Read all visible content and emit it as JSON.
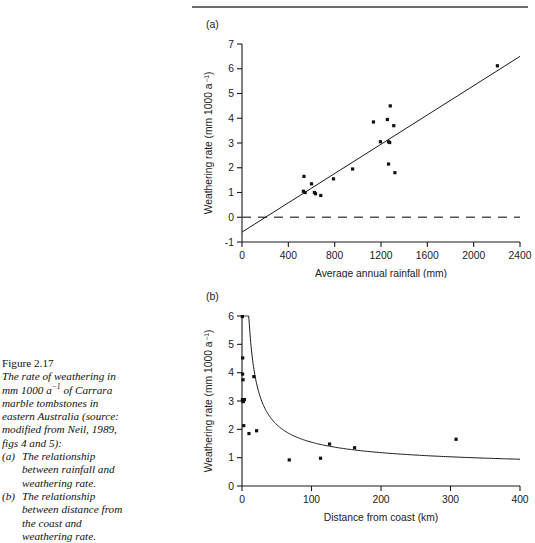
{
  "figure": {
    "number": "Figure 2.17",
    "caption_lines": [
      "The rate of weathering in",
      "mm 1000 a⁻¹ of Carrara",
      "marble tombstones in",
      "eastern Australia (source:",
      "modified from Neil, 1989,",
      "figs 4 and 5):"
    ],
    "subcaptions": [
      {
        "marker": "(a)",
        "lines": [
          "The relationship",
          "between rainfall and",
          "weathering rate."
        ]
      },
      {
        "marker": "(b)",
        "lines": [
          "The relationship",
          "between distance from",
          "the coast and",
          "weathering rate."
        ]
      }
    ]
  },
  "chart_data": [
    {
      "type": "scatter",
      "panel_label": "(a)",
      "title": "",
      "xlabel": "Average annual rainfall (mm)",
      "ylabel": "Weathering rate (mm 1000 a⁻¹)",
      "xlim": [
        0,
        2400
      ],
      "ylim": [
        -1,
        7
      ],
      "xticks": [
        0,
        400,
        800,
        1200,
        1600,
        2000,
        2400
      ],
      "xtick_labels": [
        "0",
        "400",
        "800",
        "1200",
        "1600",
        "2000",
        "2400"
      ],
      "yticks": [
        -1,
        0,
        1,
        2,
        3,
        4,
        5,
        6,
        7
      ],
      "ytick_labels": [
        "-1",
        "0",
        "1",
        "2",
        "3",
        "4",
        "5",
        "6",
        "7"
      ],
      "grid": false,
      "legend": null,
      "points": [
        {
          "x": 535,
          "y": 1.65
        },
        {
          "x": 530,
          "y": 1.05
        },
        {
          "x": 545,
          "y": 1.0
        },
        {
          "x": 600,
          "y": 1.35
        },
        {
          "x": 625,
          "y": 1.0
        },
        {
          "x": 635,
          "y": 0.95
        },
        {
          "x": 680,
          "y": 0.88
        },
        {
          "x": 790,
          "y": 1.55
        },
        {
          "x": 955,
          "y": 1.95
        },
        {
          "x": 1135,
          "y": 3.85
        },
        {
          "x": 1195,
          "y": 3.05
        },
        {
          "x": 1255,
          "y": 3.95
        },
        {
          "x": 1265,
          "y": 3.05
        },
        {
          "x": 1275,
          "y": 3.02
        },
        {
          "x": 1280,
          "y": 4.5
        },
        {
          "x": 1265,
          "y": 2.15
        },
        {
          "x": 1310,
          "y": 3.7
        },
        {
          "x": 1320,
          "y": 1.8
        },
        {
          "x": 2205,
          "y": 6.12
        }
      ],
      "fit_line": {
        "x0": 0,
        "y0": -0.6,
        "x1": 2400,
        "y1": 6.5
      },
      "reference_line": {
        "y": 0,
        "style": "dashed"
      }
    },
    {
      "type": "scatter",
      "panel_label": "(b)",
      "title": "",
      "xlabel": "Distance from coast (km)",
      "ylabel": "Weathering rate (mm 1000 a⁻¹)",
      "xlim": [
        0,
        400
      ],
      "ylim": [
        0,
        6
      ],
      "xticks": [
        0,
        100,
        200,
        300,
        400
      ],
      "xtick_labels": [
        "0",
        "100",
        "200",
        "300",
        "400"
      ],
      "yticks": [
        0,
        1,
        2,
        3,
        4,
        5,
        6
      ],
      "ytick_labels": [
        "0",
        "1",
        "2",
        "3",
        "4",
        "5",
        "6"
      ],
      "grid": false,
      "legend": null,
      "points": [
        {
          "x": 0.5,
          "y": 5.98
        },
        {
          "x": 1.0,
          "y": 4.52
        },
        {
          "x": 0.8,
          "y": 3.95
        },
        {
          "x": 1.5,
          "y": 3.75
        },
        {
          "x": 17,
          "y": 3.86
        },
        {
          "x": 0.6,
          "y": 3.05
        },
        {
          "x": 1.2,
          "y": 3.0
        },
        {
          "x": 2.0,
          "y": 2.98
        },
        {
          "x": 3.5,
          "y": 3.05
        },
        {
          "x": 2.5,
          "y": 2.13
        },
        {
          "x": 10,
          "y": 1.85
        },
        {
          "x": 21,
          "y": 1.95
        },
        {
          "x": 68,
          "y": 0.92
        },
        {
          "x": 113,
          "y": 0.98
        },
        {
          "x": 126,
          "y": 1.48
        },
        {
          "x": 162,
          "y": 1.35
        },
        {
          "x": 308,
          "y": 1.65
        }
      ],
      "fit_curve": {
        "form": "power-decay",
        "description": "y = a*x^-b fitted decay from 6 near x=0 to ~0.87 at x=400"
      }
    }
  ]
}
